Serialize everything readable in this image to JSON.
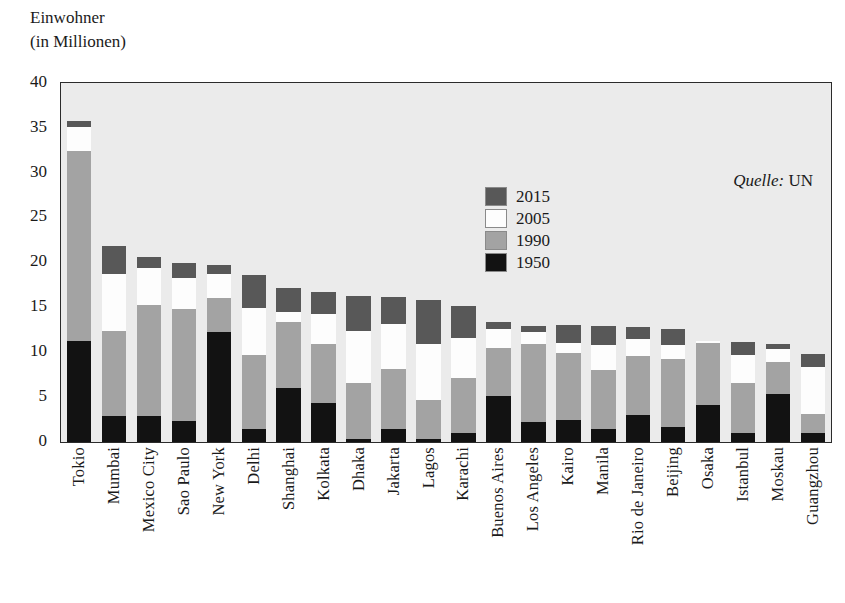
{
  "axis_title": "Einwohner\n(in Millionen)",
  "source": {
    "key": "Quelle:",
    "value": "UN"
  },
  "legend": {
    "position": "inside-top-center",
    "items": [
      {
        "label": "2015",
        "color": "#585858"
      },
      {
        "label": "2005",
        "color": "#fdfdfd"
      },
      {
        "label": "1990",
        "color": "#a3a3a3"
      },
      {
        "label": "1950",
        "color": "#121212"
      }
    ]
  },
  "chart_data": {
    "type": "bar",
    "subtype": "stacked-vertical",
    "title": "",
    "subtitle": "",
    "xlabel": "",
    "ylabel": "Einwohner (in Millionen)",
    "ylim": [
      0,
      40
    ],
    "yticks": [
      0,
      5,
      10,
      15,
      20,
      25,
      30,
      35,
      40
    ],
    "ytick_labels": [
      "0",
      "5",
      "10",
      "15",
      "20",
      "25",
      "30",
      "35",
      "40"
    ],
    "grid": false,
    "stacked_cumulative": true,
    "note": "values are cumulative stack tops in millions for each year layer",
    "categories": [
      "Tokio",
      "Mumbai",
      "Mexico City",
      "Sao Paulo",
      "New York",
      "Delhi",
      "Shanghai",
      "Kolkata",
      "Dhaka",
      "Jakarta",
      "Lagos",
      "Karachi",
      "Buenos Aires",
      "Los Angeles",
      "Kairo",
      "Manila",
      "Rio de Janeiro",
      "Beijing",
      "Osaka",
      "Istanbul",
      "Moskau",
      "Guangzhou"
    ],
    "series": [
      {
        "name": "1950",
        "color": "#121212",
        "values": [
          11.3,
          2.9,
          2.9,
          2.3,
          12.3,
          1.4,
          6.0,
          4.4,
          0.3,
          1.4,
          0.3,
          1.0,
          5.1,
          2.2,
          2.5,
          1.5,
          3.0,
          1.7,
          4.1,
          1.0,
          5.4,
          1.0
        ]
      },
      {
        "name": "1990",
        "color": "#a3a3a3",
        "values": [
          32.5,
          12.4,
          15.3,
          14.8,
          16.1,
          9.7,
          13.4,
          10.9,
          6.6,
          8.2,
          4.7,
          7.1,
          10.5,
          10.9,
          9.9,
          8.0,
          9.6,
          9.3,
          11.0,
          6.6,
          8.9,
          3.1
        ]
      },
      {
        "name": "2005",
        "color": "#fdfdfd",
        "values": [
          35.2,
          18.8,
          19.4,
          18.3,
          18.7,
          15.0,
          14.5,
          14.3,
          12.4,
          13.2,
          10.9,
          11.6,
          12.6,
          12.3,
          11.1,
          10.8,
          11.5,
          10.8,
          11.3,
          9.7,
          10.4,
          8.4
        ]
      },
      {
        "name": "2015",
        "color": "#585858",
        "values": [
          35.8,
          21.9,
          20.7,
          20.0,
          19.7,
          18.6,
          17.2,
          16.7,
          16.3,
          16.2,
          15.8,
          15.2,
          13.4,
          12.9,
          13.1,
          12.9,
          12.8,
          12.6,
          11.3,
          11.2,
          10.9,
          9.8
        ]
      }
    ]
  }
}
